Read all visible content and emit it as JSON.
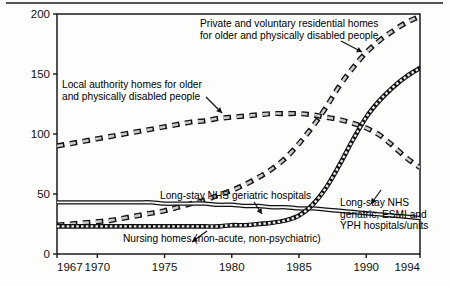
{
  "figure": {
    "ylabel": "Numbers of beds (thousands)",
    "background": "#ffffff",
    "frame_color": "#1a1a1a"
  },
  "chart_data": {
    "type": "line",
    "title": "",
    "xlabel": "",
    "ylabel": "Numbers of beds (thousands)",
    "xlim": [
      1967,
      1994
    ],
    "ylim": [
      0,
      200
    ],
    "yticks": [
      0,
      50,
      100,
      150,
      200
    ],
    "xticks": [
      1967,
      1970,
      1975,
      1980,
      1985,
      1990,
      1994
    ],
    "ytick_labels": [
      "0",
      "50",
      "100",
      "150",
      "200"
    ],
    "xtick_labels": [
      "1967",
      "1970",
      "1975",
      "1980",
      "1985",
      "1990",
      "1994"
    ],
    "grid": false,
    "legend_position": "inline-annotations",
    "x": [
      1967,
      1968,
      1969,
      1970,
      1971,
      1972,
      1973,
      1974,
      1975,
      1976,
      1977,
      1978,
      1979,
      1980,
      1981,
      1982,
      1983,
      1984,
      1985,
      1986,
      1987,
      1988,
      1989,
      1990,
      1991,
      1992,
      1993,
      1994
    ],
    "series": [
      {
        "name": "Local authority homes for older and physically disabled people",
        "style": "dashed",
        "values": [
          90,
          92,
          94,
          96,
          98,
          100,
          102,
          104,
          106,
          108,
          110,
          111,
          113,
          114,
          115,
          116,
          117,
          117,
          117,
          116,
          114,
          112,
          109,
          105,
          99,
          90,
          80,
          72
        ]
      },
      {
        "name": "Private and voluntary residential homes for older and physically disabled people",
        "style": "dashed",
        "values": [
          24,
          25,
          26,
          27,
          28,
          30,
          32,
          34,
          36,
          39,
          42,
          45,
          49,
          53,
          58,
          64,
          71,
          80,
          92,
          106,
          122,
          140,
          155,
          168,
          178,
          186,
          193,
          198
        ]
      },
      {
        "name": "Long-stay NHS geriatric hospitals",
        "style": "solid",
        "values": [
          43,
          43,
          43,
          43,
          43,
          43,
          43,
          43,
          42,
          42,
          42,
          42,
          41,
          41,
          40,
          40,
          39,
          39,
          38,
          38,
          37,
          36,
          35,
          34,
          33,
          32,
          31,
          30
        ]
      },
      {
        "name": "Nursing homes (non-acute, non-psychiatric)",
        "style": "beaded",
        "values": [
          23,
          23,
          23,
          23,
          23,
          23,
          23,
          23,
          23,
          23,
          23,
          23,
          23,
          24,
          24,
          25,
          26,
          28,
          32,
          41,
          55,
          74,
          95,
          114,
          128,
          139,
          148,
          155
        ]
      }
    ],
    "annotations": [
      {
        "id": "private-voluntary",
        "lines": [
          "Private and voluntary residential homes",
          "for older and physically disabled people"
        ],
        "points_to_series": "Private and voluntary residential homes for older and physically disabled people"
      },
      {
        "id": "local-authority",
        "lines": [
          "Local authority homes for older",
          "and physically disabled people"
        ],
        "points_to_series": "Local authority homes for older and physically disabled people"
      },
      {
        "id": "long-stay-geriatric",
        "lines": [
          "Long-stay NHS geriatric hospitals"
        ],
        "points_to_series": "Long-stay NHS geriatric hospitals"
      },
      {
        "id": "long-stay-esmi",
        "lines": [
          "Long-stay NHS",
          "geriatric, ESMI and",
          "YPH hospitals/units"
        ],
        "points_to_series": "Long-stay NHS geriatric hospitals"
      },
      {
        "id": "nursing-homes",
        "lines": [
          "Nursing homes (non-acute, non-psychiatric)"
        ],
        "points_to_series": "Nursing homes (non-acute, non-psychiatric)"
      }
    ]
  }
}
